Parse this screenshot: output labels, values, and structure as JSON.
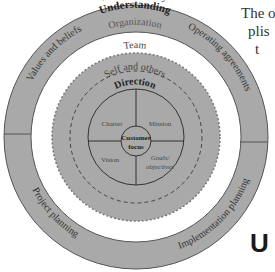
{
  "diagram": {
    "outer_ring": {
      "top_label": "Accountability",
      "segments": [
        "Values and beliefs",
        "Operating agreements",
        "Implementation planning",
        "Project planning"
      ]
    },
    "understanding_ring": {
      "title": "Understanding",
      "subtitle": "Organization"
    },
    "team_disc": {
      "label": "Team"
    },
    "self_ring": {
      "label": "Self and others"
    },
    "direction_circle": {
      "title": "Direction",
      "quadrants": [
        "Charter",
        "Mission",
        "Vision",
        "Goals/",
        "objectives"
      ]
    },
    "center": {
      "line1": "Customer",
      "line2": "focus"
    },
    "colors": {
      "ring_fill": "#a9a9a9",
      "line": "#3a3a3a",
      "text": "#333333"
    }
  },
  "side_text": {
    "line1": "The o",
    "line2": "plis",
    "line3": "t"
  },
  "bottom_letter": "U"
}
